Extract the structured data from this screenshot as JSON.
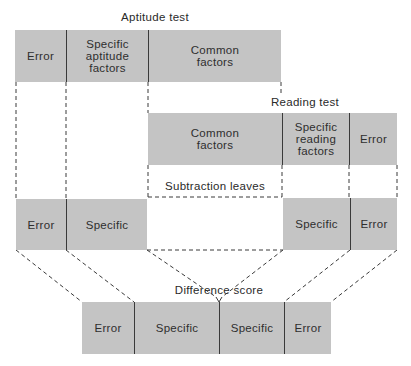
{
  "diagram": {
    "aptitude_test": {
      "title": "Aptitude test",
      "segments": [
        {
          "label": "Error"
        },
        {
          "label": "Specific\naptitude\nfactors"
        },
        {
          "label": "Common\nfactors"
        }
      ]
    },
    "reading_test": {
      "title": "Reading test",
      "segments": [
        {
          "label": "Common\nfactors"
        },
        {
          "label": "Specific\nreading\nfactors"
        },
        {
          "label": "Error"
        }
      ]
    },
    "subtraction": {
      "label": "Subtraction leaves",
      "left_segments": [
        {
          "label": "Error"
        },
        {
          "label": "Specific"
        }
      ],
      "right_segments": [
        {
          "label": "Specific"
        },
        {
          "label": "Error"
        }
      ]
    },
    "difference_score": {
      "title": "Difference score",
      "segments": [
        {
          "label": "Error"
        },
        {
          "label": "Specific"
        },
        {
          "label": "Specific"
        },
        {
          "label": "Error"
        }
      ]
    },
    "colors": {
      "box_fill": "#c4c4c4",
      "divider": "#3a3a3a",
      "dashed_line": "#3a3a3a",
      "text": "#2a2a2a"
    }
  }
}
